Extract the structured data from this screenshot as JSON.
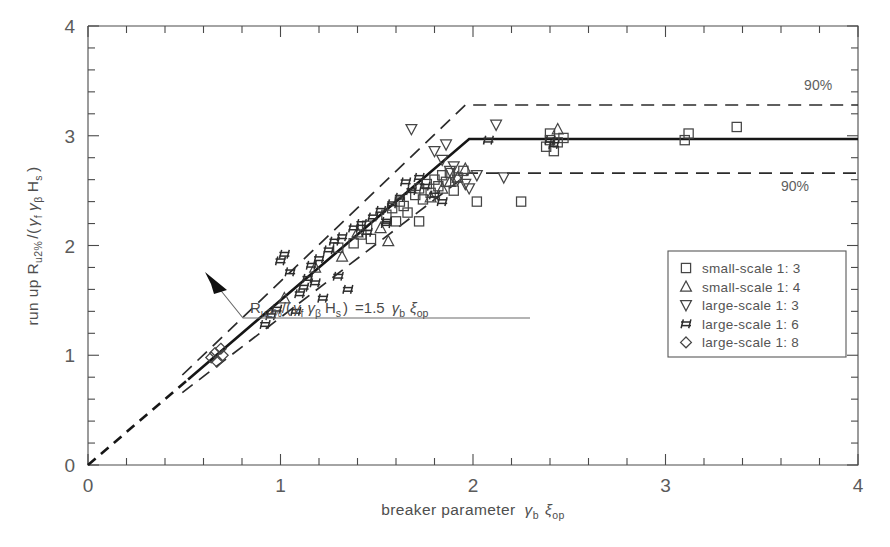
{
  "figure": {
    "background": "#ffffff",
    "ink_color": "#3a3a3a"
  },
  "chart_data": {
    "type": "scatter",
    "title": "",
    "subtitle": "",
    "xlabel": "breaker parameter γb ξop",
    "ylabel": "run up Ru2% /(γf γβ Hs )",
    "xlim": [
      0,
      4
    ],
    "ylim": [
      0,
      4
    ],
    "grid": false,
    "xticks": [
      0,
      1,
      2,
      3,
      4
    ],
    "yticks": [
      0,
      1,
      2,
      3,
      4
    ],
    "xtick_labels": [
      "0",
      "1",
      "2",
      "3",
      "4"
    ],
    "ytick_labels": [
      "0",
      "1",
      "2",
      "3",
      "4"
    ],
    "minor_tick_step": 0.2,
    "legend_position": "right-middle",
    "annotations": [
      {
        "name": "design-formula",
        "text": "Ru2% /(γf γβ Hs ) =1.5 γb ξop",
        "x": 1.23,
        "y": 1.72,
        "points_to": [
          1.13,
          1.7
        ]
      },
      {
        "name": "upper-confidence-label",
        "text": "90%",
        "x": 3.72,
        "y": 3.42
      },
      {
        "name": "lower-confidence-label",
        "text": "90%",
        "x": 3.6,
        "y": 2.5
      }
    ],
    "series": [
      {
        "name": "small-scale 1: 3",
        "marker": "square",
        "legend_label": "small-scale 1: 3",
        "points": [
          [
            1.3,
            1.98
          ],
          [
            1.38,
            2.02
          ],
          [
            1.42,
            2.1
          ],
          [
            1.45,
            2.18
          ],
          [
            1.47,
            2.06
          ],
          [
            1.55,
            2.28
          ],
          [
            1.58,
            2.34
          ],
          [
            1.6,
            2.22
          ],
          [
            1.62,
            2.4
          ],
          [
            1.64,
            2.36
          ],
          [
            1.66,
            2.3
          ],
          [
            1.7,
            2.46
          ],
          [
            1.72,
            2.52
          ],
          [
            1.74,
            2.42
          ],
          [
            1.76,
            2.56
          ],
          [
            1.78,
            2.48
          ],
          [
            1.8,
            2.6
          ],
          [
            1.82,
            2.54
          ],
          [
            1.84,
            2.64
          ],
          [
            1.86,
            2.58
          ],
          [
            1.88,
            2.66
          ],
          [
            1.9,
            2.5
          ],
          [
            1.92,
            2.62
          ],
          [
            1.95,
            2.68
          ],
          [
            1.72,
            2.22
          ],
          [
            2.02,
            2.4
          ],
          [
            2.25,
            2.4
          ],
          [
            2.38,
            2.9
          ],
          [
            2.4,
            2.96
          ],
          [
            2.4,
            3.02
          ],
          [
            2.42,
            2.86
          ],
          [
            2.44,
            2.94
          ],
          [
            2.47,
            2.98
          ],
          [
            3.1,
            2.96
          ],
          [
            3.12,
            3.02
          ],
          [
            3.37,
            3.08
          ]
        ]
      },
      {
        "name": "small-scale 1: 4",
        "marker": "triangle-up",
        "legend_label": "small-scale 1: 4",
        "points": [
          [
            1.02,
            1.52
          ],
          [
            1.18,
            1.8
          ],
          [
            1.32,
            1.9
          ],
          [
            1.4,
            2.12
          ],
          [
            1.52,
            2.16
          ],
          [
            1.56,
            2.04
          ],
          [
            1.78,
            2.44
          ],
          [
            1.84,
            2.52
          ],
          [
            1.88,
            2.58
          ],
          [
            1.92,
            2.62
          ],
          [
            1.96,
            2.7
          ],
          [
            2.44,
            3.06
          ]
        ]
      },
      {
        "name": "large-scale 1: 3",
        "marker": "triangle-down",
        "legend_label": "large-scale 1: 3",
        "points": [
          [
            1.68,
            3.06
          ],
          [
            1.8,
            2.86
          ],
          [
            1.84,
            2.78
          ],
          [
            1.86,
            2.92
          ],
          [
            1.88,
            2.68
          ],
          [
            1.9,
            2.72
          ],
          [
            1.92,
            2.6
          ],
          [
            1.96,
            2.56
          ],
          [
            1.98,
            2.52
          ],
          [
            2.02,
            2.64
          ],
          [
            2.12,
            3.1
          ],
          [
            2.16,
            2.62
          ]
        ]
      },
      {
        "name": "large-scale 1: 6",
        "marker": "hash",
        "legend_label": "large-scale 1: 6",
        "points": [
          [
            0.92,
            1.28
          ],
          [
            0.95,
            1.36
          ],
          [
            0.98,
            1.42
          ],
          [
            1.0,
            1.86
          ],
          [
            1.02,
            1.92
          ],
          [
            1.05,
            1.76
          ],
          [
            1.08,
            1.4
          ],
          [
            1.1,
            1.56
          ],
          [
            1.12,
            1.62
          ],
          [
            1.14,
            1.7
          ],
          [
            1.16,
            1.82
          ],
          [
            1.18,
            1.66
          ],
          [
            1.2,
            1.88
          ],
          [
            1.22,
            1.52
          ],
          [
            1.25,
            1.96
          ],
          [
            1.28,
            2.04
          ],
          [
            1.3,
            1.72
          ],
          [
            1.32,
            2.08
          ],
          [
            1.35,
            1.6
          ],
          [
            1.38,
            2.16
          ],
          [
            1.42,
            2.2
          ],
          [
            1.45,
            2.12
          ],
          [
            1.48,
            2.26
          ],
          [
            1.52,
            2.32
          ],
          [
            1.55,
            2.22
          ],
          [
            1.58,
            2.38
          ],
          [
            1.62,
            2.44
          ],
          [
            1.65,
            2.58
          ],
          [
            1.68,
            2.5
          ],
          [
            1.72,
            2.62
          ],
          [
            1.75,
            2.54
          ],
          [
            1.8,
            2.46
          ],
          [
            1.55,
            2.2
          ],
          [
            1.84,
            2.4
          ],
          [
            2.08,
            2.96
          ],
          [
            2.4,
            2.96
          ],
          [
            2.42,
            2.92
          ]
        ]
      },
      {
        "name": "large-scale 1: 8",
        "marker": "diamond",
        "legend_label": "large-scale 1: 8",
        "points": [
          [
            0.64,
            0.98
          ],
          [
            0.66,
            1.02
          ],
          [
            0.67,
            0.94
          ],
          [
            0.69,
            1.06
          ],
          [
            0.7,
            1.0
          ]
        ]
      }
    ],
    "lines": [
      {
        "name": "design-line",
        "style": "solid-with-dashed-origin",
        "description": "Ru2%/(γf γβ Hs) = 1.5 γb ξop, capped at 2.97",
        "slope": 1.5,
        "cap_value": 2.97,
        "breakpoint_x": 1.98,
        "dashed_until_x": 0.52,
        "points": [
          [
            0.0,
            0.0
          ],
          [
            1.98,
            2.97
          ],
          [
            4.0,
            2.97
          ]
        ]
      },
      {
        "name": "upper-90-percent-line",
        "style": "dashed",
        "slope": 1.67,
        "cap_value": 3.28,
        "breakpoint_x": 1.96,
        "start_x": 0.49,
        "points": [
          [
            0.49,
            0.82
          ],
          [
            1.96,
            3.28
          ],
          [
            4.0,
            3.28
          ]
        ]
      },
      {
        "name": "lower-90-percent-line",
        "style": "dashed",
        "slope": 1.34,
        "cap_value": 2.66,
        "breakpoint_x": 1.98,
        "start_x": 0.49,
        "points": [
          [
            0.49,
            0.66
          ],
          [
            1.98,
            2.66
          ],
          [
            4.0,
            2.66
          ]
        ]
      }
    ],
    "legend_entries": [
      {
        "marker": "square",
        "label": "small-scale 1: 3"
      },
      {
        "marker": "triangle-up",
        "label": "small-scale 1: 4"
      },
      {
        "marker": "triangle-down",
        "label": "large-scale 1: 3"
      },
      {
        "marker": "hash",
        "label": "large-scale 1: 6"
      },
      {
        "marker": "diamond",
        "label": "large-scale 1: 8"
      }
    ]
  },
  "axis_labels": {
    "y_prefix": "run up R",
    "y_sub1": "u2%",
    "y_mid": "/(",
    "y_g1": "γ",
    "y_g1sub": "f",
    "y_g2": "γ",
    "y_g2sub": "β",
    "y_h": "H",
    "y_hsub": "s",
    "y_close": ")",
    "x_prefix": "breaker parameter",
    "x_g": "γ",
    "x_gsub": "b",
    "x_xi": "ξ",
    "x_xisub": "op"
  },
  "annotation_formula": {
    "r": "R",
    "r_sub": "u2%",
    "slash_open": "/(",
    "gf": "γ",
    "gf_sub": "f",
    "gb": "γ",
    "gb_sub": "β",
    "h": "H",
    "h_sub": "s",
    "close": ")",
    "equals": "=1.5",
    "gamma_b": "γ",
    "gamma_b_sub": "b",
    "xi": "ξ",
    "xi_sub": "op"
  },
  "confidence_labels": {
    "upper": "90%",
    "lower": "90%"
  }
}
